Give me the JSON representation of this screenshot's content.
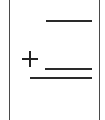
{
  "worksheet": {
    "problem": {
      "operator": "+",
      "operator_icon": "plus-icon",
      "addend_1": "",
      "addend_2": "",
      "sum": ""
    },
    "colors": {
      "ink": "#222222",
      "border": "#4a4a4a",
      "background": "#ffffff"
    }
  }
}
